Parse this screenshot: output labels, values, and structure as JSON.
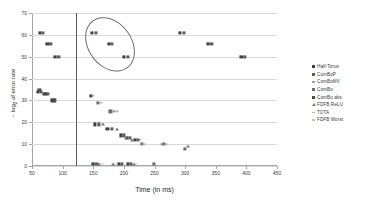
{
  "chart_data": {
    "type": "scatter",
    "title": "",
    "xlabel": "Time (in ms)",
    "ylabel": "− log₂ of error rate",
    "xlim": [
      50,
      450
    ],
    "ylim": [
      0,
      70
    ],
    "xticks": [
      50,
      100,
      150,
      200,
      250,
      300,
      350,
      400,
      450
    ],
    "yticks": [
      0,
      10,
      20,
      30,
      40,
      50,
      60,
      70
    ],
    "grid": "horizontal",
    "legend_position": "right",
    "annotations": [
      {
        "kind": "vertical-line",
        "x": 122,
        "color": "#5a5a5a"
      },
      {
        "kind": "ellipse",
        "label": "highlighted-cluster",
        "cx": 175,
        "cy": 56,
        "rx": 34,
        "ry": 13,
        "rotation_deg": -36,
        "color": "#6e6e6e"
      }
    ],
    "series": [
      {
        "name": "Half-Torus",
        "marker": "square",
        "color": "#3f3f3f",
        "points": [
          [
            63,
            61
          ],
          [
            75,
            56
          ],
          [
            88,
            50
          ],
          [
            148,
            61
          ],
          [
            175,
            56
          ],
          [
            200,
            50
          ],
          [
            292,
            61
          ],
          [
            337,
            56
          ],
          [
            392,
            50
          ],
          [
            60,
            34
          ],
          [
            70,
            33
          ],
          [
            83,
            30
          ],
          [
            146,
            32
          ],
          [
            153,
            19
          ],
          [
            173,
            17
          ],
          [
            195,
            14
          ],
          [
            205,
            13
          ],
          [
            218,
            12
          ],
          [
            150,
            1
          ],
          [
            192,
            1
          ],
          [
            207,
            1
          ]
        ]
      },
      {
        "name": "ComBoP",
        "marker": "square",
        "color": "#5c5c5c",
        "points": [
          [
            68,
            61
          ],
          [
            80,
            56
          ],
          [
            93,
            50
          ],
          [
            154,
            61
          ],
          [
            181,
            56
          ],
          [
            207,
            50
          ],
          [
            298,
            61
          ],
          [
            343,
            56
          ],
          [
            397,
            50
          ],
          [
            65,
            34
          ],
          [
            75,
            33
          ],
          [
            88,
            30
          ],
          [
            159,
            19
          ],
          [
            180,
            17
          ],
          [
            200,
            14
          ],
          [
            210,
            13
          ],
          [
            223,
            12
          ],
          [
            155,
            1
          ],
          [
            197,
            1
          ],
          [
            212,
            1
          ]
        ]
      },
      {
        "name": "ComBoMV",
        "marker": "dash",
        "color": "#9e9e9e",
        "points": [
          [
            150,
            32
          ],
          [
            163,
            29
          ],
          [
            184,
            25
          ],
          [
            214,
            12
          ],
          [
            226,
            12
          ],
          [
            263,
            10
          ]
        ]
      },
      {
        "name": "ComBo",
        "marker": "square",
        "color": "#6b6b6b",
        "points": [
          [
            157,
            29
          ],
          [
            178,
            25
          ],
          [
            229,
            10
          ],
          [
            265,
            10
          ],
          [
            300,
            8
          ],
          [
            249,
            1
          ]
        ]
      },
      {
        "name": "ComBo abs",
        "marker": "square",
        "color": "#4a4a4a",
        "points": [
          [
            62,
            35
          ],
          [
            72,
            33
          ],
          [
            86,
            30
          ]
        ]
      },
      {
        "name": "FDFB ReLU",
        "marker": "triangle",
        "color": "#7a7a7a",
        "points": [
          [
            166,
            19
          ],
          [
            188,
            17
          ],
          [
            203,
            13
          ],
          [
            213,
            12
          ],
          [
            305,
            9
          ],
          [
            159,
            1
          ],
          [
            183,
            1
          ],
          [
            216,
            1
          ]
        ]
      },
      {
        "name": "TOTA",
        "marker": "dash",
        "color": "#b5b5b5",
        "points": [
          [
            188,
            25
          ],
          [
            233,
            10
          ],
          [
            268,
            10
          ]
        ]
      },
      {
        "name": "FDFB Worst",
        "marker": "dash",
        "color": "#c0c0c0",
        "points": [
          [
            164,
            1
          ],
          [
            187,
            1
          ],
          [
            220,
            1
          ]
        ]
      }
    ]
  },
  "legend": {
    "items": [
      {
        "label": "Half-Torus",
        "marker": "square",
        "color": "#3f3f3f"
      },
      {
        "label": "ComBoP",
        "marker": "square",
        "color": "#5c5c5c"
      },
      {
        "label": "ComBoMV",
        "marker": "dash",
        "color": "#9e9e9e"
      },
      {
        "label": "ComBo",
        "marker": "square",
        "color": "#6b6b6b"
      },
      {
        "label": "ComBo abs",
        "marker": "square",
        "color": "#4a4a4a"
      },
      {
        "label": "FDFB ReLU",
        "marker": "triangle",
        "color": "#7a7a7a"
      },
      {
        "label": "TOTA",
        "marker": "dash",
        "color": "#b5b5b5"
      },
      {
        "label": "FDFB Worst",
        "marker": "dash",
        "color": "#c0c0c0"
      }
    ]
  },
  "axis": {
    "x_title": "Time (in ms)",
    "y_title_main": "− log",
    "y_title_sub": "2",
    "y_title_rest": " of error rate"
  }
}
